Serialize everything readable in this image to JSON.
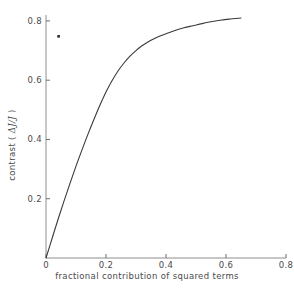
{
  "chart_data": {
    "type": "line",
    "title": "",
    "subtitle": "",
    "xlabel": "fractional contribution of squared terms",
    "ylabel": "contrast ( ΔJ/J )",
    "ylabel_prefix": "contrast ( ",
    "ylabel_symbol": "ΔJ/J",
    "ylabel_suffix": " )",
    "xlim": [
      0,
      0.8
    ],
    "ylim": [
      0,
      0.82
    ],
    "grid": false,
    "legend": null,
    "xticks": [
      0,
      0.2,
      0.4,
      0.6,
      0.8
    ],
    "xtick_labels": [
      "0",
      "0.2",
      "0.4",
      "0.6",
      "0.8"
    ],
    "yticks": [
      0.2,
      0.4,
      0.6,
      0.8
    ],
    "ytick_labels": [
      "0.2",
      "0.4",
      "0.6",
      "0.8"
    ],
    "line_color": "#3a3a3a",
    "series": [
      {
        "name": "contrast curve",
        "type": "line",
        "x": [
          0.0,
          0.02,
          0.04,
          0.06,
          0.08,
          0.1,
          0.12,
          0.14,
          0.16,
          0.18,
          0.2,
          0.22,
          0.24,
          0.26,
          0.28,
          0.3,
          0.32,
          0.34,
          0.36,
          0.38,
          0.4,
          0.43,
          0.46,
          0.49,
          0.52,
          0.55,
          0.58,
          0.61,
          0.65
        ],
        "y": [
          0.0,
          0.065,
          0.13,
          0.192,
          0.252,
          0.31,
          0.365,
          0.418,
          0.468,
          0.516,
          0.56,
          0.598,
          0.631,
          0.658,
          0.681,
          0.7,
          0.716,
          0.729,
          0.74,
          0.749,
          0.757,
          0.768,
          0.777,
          0.784,
          0.791,
          0.797,
          0.802,
          0.806,
          0.81
        ]
      },
      {
        "name": "isolated point",
        "type": "scatter",
        "x": [
          0.042
        ],
        "y": [
          0.748
        ],
        "marker": "dot",
        "color": "#2a2a2a"
      }
    ]
  },
  "axes": {
    "x_axis_name": "x-axis",
    "y_axis_name": "y-axis"
  }
}
